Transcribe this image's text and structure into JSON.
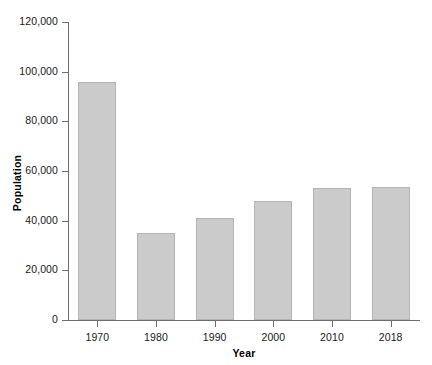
{
  "chart_data": {
    "type": "bar",
    "title": "",
    "subtitle": "",
    "xlabel": "Year",
    "ylabel": "Population",
    "categories": [
      "1970",
      "1980",
      "1990",
      "2000",
      "2010",
      "2018"
    ],
    "values": [
      96000,
      35000,
      41000,
      48000,
      53000,
      53500
    ],
    "ylim": [
      0,
      120000
    ],
    "yticks": [
      0,
      20000,
      40000,
      60000,
      80000,
      100000,
      120000
    ],
    "ytick_labels": [
      "0",
      "20,000",
      "40,000",
      "60,000",
      "80,000",
      "100,000",
      "120,000"
    ],
    "grid": false,
    "legend": false,
    "legend_position": "none",
    "series": [
      {
        "name": "Population",
        "values": [
          96000,
          35000,
          41000,
          48000,
          53000,
          53500
        ]
      }
    ],
    "colors": {
      "bar_fill": "#cbcbcb",
      "bar_edge": "#b4b4b4",
      "axis": "#6e6e6e",
      "text": "#1a1a1a",
      "background": "#ffffff"
    }
  }
}
